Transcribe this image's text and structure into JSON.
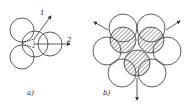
{
  "figure_a": {
    "caption": "a)",
    "arrow_1_label": "1",
    "arrow_2_label": "2"
  },
  "figure_b": {
    "caption": "b)"
  },
  "colors": {
    "stroke": "#333333",
    "background": "#ffffff"
  }
}
